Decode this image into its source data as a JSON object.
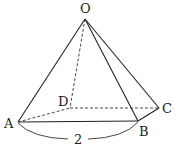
{
  "diagram": {
    "type": "square-pyramid",
    "vertices": {
      "O": {
        "label": "O",
        "x": 85,
        "y": 19
      },
      "A": {
        "label": "A",
        "x": 18,
        "y": 122
      },
      "B": {
        "label": "B",
        "x": 138,
        "y": 121
      },
      "C": {
        "label": "C",
        "x": 159,
        "y": 108
      },
      "D": {
        "label": "D",
        "x": 70,
        "y": 108
      }
    },
    "solid_edges": [
      [
        "O",
        "A"
      ],
      [
        "O",
        "B"
      ],
      [
        "O",
        "C"
      ],
      [
        "A",
        "B"
      ],
      [
        "B",
        "C"
      ]
    ],
    "hidden_edges": [
      [
        "O",
        "D"
      ],
      [
        "A",
        "D"
      ],
      [
        "D",
        "C"
      ]
    ],
    "measurement": {
      "edge": "AB",
      "value": "2"
    }
  }
}
